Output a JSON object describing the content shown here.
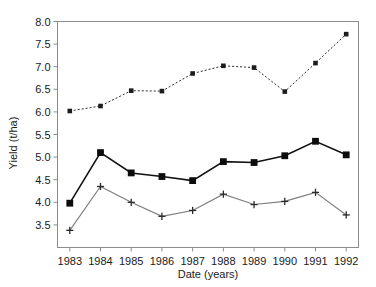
{
  "chart_data": {
    "type": "line",
    "title": "",
    "xlabel": "Date (years)",
    "ylabel": "Yield (t/ha)",
    "x": [
      1983,
      1984,
      1985,
      1986,
      1987,
      1988,
      1989,
      1990,
      1991,
      1992
    ],
    "categories": [
      "1983",
      "1984",
      "1985",
      "1986",
      "1987",
      "1988",
      "1989",
      "1990",
      "1991",
      "1992"
    ],
    "xtick_labels": [
      "1983",
      "1984",
      "1985",
      "1986",
      "1987",
      "1988",
      "1989",
      "1990",
      "1991",
      "1992"
    ],
    "ytick_labels": [
      "3.5",
      "4.0",
      "4.5",
      "5.0",
      "5.5",
      "6.0",
      "6.5",
      "7.0",
      "7.5",
      "8.0"
    ],
    "ytick_values": [
      3.5,
      4.0,
      4.5,
      5.0,
      5.5,
      6.0,
      6.5,
      7.0,
      7.5,
      8.0
    ],
    "ylim": [
      3.0,
      8.0
    ],
    "xlim": [
      1982.6,
      1992.4
    ],
    "grid": false,
    "legend": "none",
    "series": [
      {
        "name": "upper",
        "marker": "small-square",
        "linestyle": "dotted",
        "color": "#2b2b2b",
        "values": [
          6.02,
          6.13,
          6.47,
          6.46,
          6.85,
          7.02,
          6.98,
          6.45,
          7.08,
          7.72
        ]
      },
      {
        "name": "middle",
        "marker": "filled-square",
        "linestyle": "solid",
        "color": "#121212",
        "values": [
          3.98,
          5.1,
          4.65,
          4.57,
          4.48,
          4.9,
          4.88,
          5.03,
          5.35,
          5.05
        ]
      },
      {
        "name": "lower",
        "marker": "plus",
        "linestyle": "solid",
        "color": "#7d7d7d",
        "values": [
          3.38,
          4.35,
          4.0,
          3.69,
          3.82,
          4.18,
          3.95,
          4.02,
          4.22,
          3.72
        ]
      }
    ]
  },
  "axes": {
    "y_axis_title": "Yield (t/ha)",
    "x_axis_title": "Date (years)"
  }
}
